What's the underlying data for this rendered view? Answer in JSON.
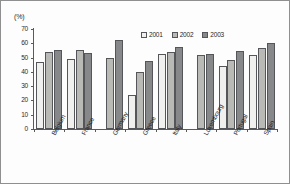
{
  "chart_data": {
    "type": "bar",
    "title": "",
    "subtitle": "",
    "xlabel": "",
    "ylabel": "(%)",
    "ylim": [
      0,
      70
    ],
    "yticks": [
      0,
      10,
      20,
      30,
      40,
      50,
      60,
      70
    ],
    "grid": false,
    "legend_position": "top-right",
    "categories": [
      "Belgium",
      "France",
      "Germany",
      "Greece",
      "Italy",
      "Luxembourg",
      "Portugal",
      "Spain"
    ],
    "series": [
      {
        "name": "2001",
        "color": "#f0f0ee",
        "values": [
          47,
          49,
          null,
          23.5,
          52.5,
          null,
          44,
          52
        ]
      },
      {
        "name": "2002",
        "color": "#b9b9b6",
        "values": [
          54,
          55.5,
          49.5,
          40,
          54,
          51.5,
          48.5,
          57
        ]
      },
      {
        "name": "2003",
        "color": "#87888a",
        "values": [
          55.5,
          53,
          62,
          47.5,
          57.5,
          52.5,
          54.5,
          60.5
        ]
      }
    ]
  },
  "legend": {
    "items": [
      {
        "label": "2001"
      },
      {
        "label": "2002"
      },
      {
        "label": "2003"
      }
    ]
  },
  "axis": {
    "unit": "(%)",
    "tick_labels": [
      "70",
      "60",
      "50",
      "40",
      "30",
      "20",
      "10",
      "0"
    ]
  }
}
